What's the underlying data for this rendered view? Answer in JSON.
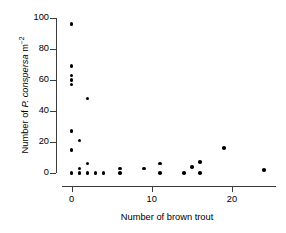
{
  "chart_data": {
    "type": "scatter",
    "title": "",
    "xlabel": "Number of brown trout",
    "ylabel_plain": "Number of P. conspersa m-2",
    "ylabel_parts": {
      "prefix": "Number of ",
      "species": "P. conspersa",
      "unit": " m",
      "exponent": "−2"
    },
    "xlim": [
      -1.2,
      25.5
    ],
    "ylim": [
      0,
      100
    ],
    "xticks": [
      0,
      10,
      20
    ],
    "xticklabels": [
      "0",
      "10",
      "20"
    ],
    "yticks": [
      0,
      20,
      40,
      60,
      80,
      100
    ],
    "yticklabels": [
      "0",
      "20",
      "40",
      "60",
      "80",
      "100"
    ],
    "grid": false,
    "legend": null,
    "marker": "filled-circle",
    "marker_color": "#000000",
    "axis_color": "#3b3b3b",
    "points": [
      {
        "x": 0,
        "y": 96
      },
      {
        "x": 0,
        "y": 69
      },
      {
        "x": 0,
        "y": 63
      },
      {
        "x": 0,
        "y": 60
      },
      {
        "x": 0,
        "y": 57
      },
      {
        "x": 2,
        "y": 48
      },
      {
        "x": 0,
        "y": 27
      },
      {
        "x": 1,
        "y": 21
      },
      {
        "x": 0,
        "y": 15
      },
      {
        "x": 19,
        "y": 16
      },
      {
        "x": 2,
        "y": 6
      },
      {
        "x": 11,
        "y": 6
      },
      {
        "x": 16,
        "y": 7
      },
      {
        "x": 15,
        "y": 4
      },
      {
        "x": 1,
        "y": 3
      },
      {
        "x": 6,
        "y": 3
      },
      {
        "x": 9,
        "y": 3
      },
      {
        "x": 24,
        "y": 2
      },
      {
        "x": 0,
        "y": 0
      },
      {
        "x": 1,
        "y": 0
      },
      {
        "x": 2,
        "y": 0
      },
      {
        "x": 3,
        "y": 0
      },
      {
        "x": 4,
        "y": 0
      },
      {
        "x": 6,
        "y": 0
      },
      {
        "x": 11,
        "y": 0
      },
      {
        "x": 14,
        "y": 0
      },
      {
        "x": 16,
        "y": 0
      }
    ]
  }
}
